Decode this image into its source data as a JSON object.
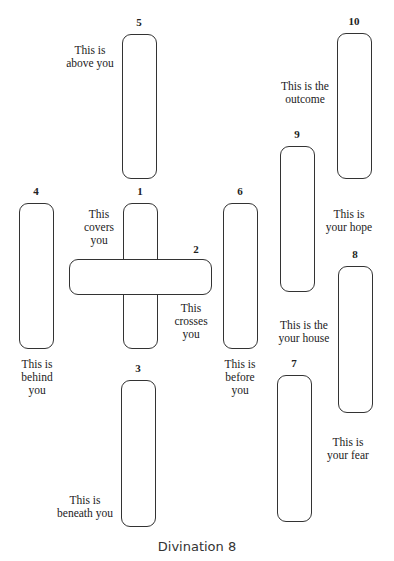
{
  "title": "Divination 8",
  "cards": [
    {
      "num": "1",
      "label": "This\ncovers\nyou"
    },
    {
      "num": "2",
      "label": "This\ncrosses\nyou"
    },
    {
      "num": "3",
      "label": "This is\nbeneath you"
    },
    {
      "num": "4",
      "label": "This is\nbehind\nyou"
    },
    {
      "num": "5",
      "label": "This is\nabove you"
    },
    {
      "num": "6",
      "label": "This is\nbefore\nyou"
    },
    {
      "num": "7",
      "label": "This is\nyour fear"
    },
    {
      "num": "8",
      "label": "This is the\nyour house"
    },
    {
      "num": "9",
      "label": "This is\nyour hope"
    },
    {
      "num": "10",
      "label": "This is the\noutcome"
    }
  ]
}
